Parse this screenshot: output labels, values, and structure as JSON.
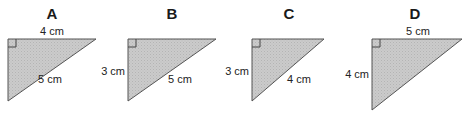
{
  "figure": {
    "fill_color": "#c9c9c9",
    "stroke_color": "#555555",
    "triangles": [
      {
        "id": "A",
        "label": "A",
        "top_label": "4 cm",
        "left_label": "",
        "hyp_label": "5 cm"
      },
      {
        "id": "B",
        "label": "B",
        "top_label": "",
        "left_label": "3 cm",
        "hyp_label": "5 cm"
      },
      {
        "id": "C",
        "label": "C",
        "top_label": "",
        "left_label": "3 cm",
        "hyp_label": "4 cm"
      },
      {
        "id": "D",
        "label": "D",
        "top_label": "5 cm",
        "left_label": "4 cm",
        "hyp_label": ""
      }
    ]
  }
}
